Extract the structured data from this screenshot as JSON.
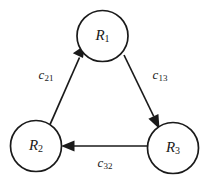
{
  "diagram": {
    "type": "directed-graph",
    "title": "",
    "background_color": "#ffffff",
    "stroke_color": "#1a1a1a",
    "nodes": [
      {
        "id": "R1",
        "base": "R",
        "subscript": "1",
        "label": "R1",
        "cx": 102.5,
        "cy": 36,
        "r": 25.5
      },
      {
        "id": "R2",
        "base": "R",
        "subscript": "2",
        "label": "R2",
        "cx": 36,
        "cy": 146,
        "r": 25.5
      },
      {
        "id": "R3",
        "base": "R",
        "subscript": "3",
        "label": "R3",
        "cx": 173,
        "cy": 148,
        "r": 25.5
      }
    ],
    "edges": [
      {
        "id": "e21",
        "from": "R2",
        "to": "R1",
        "base": "c",
        "subscript": "21",
        "label": "c21",
        "label_x": 46,
        "label_y": 76
      },
      {
        "id": "e13",
        "from": "R1",
        "to": "R3",
        "base": "c",
        "subscript": "13",
        "label": "c13",
        "label_x": 160,
        "label_y": 76
      },
      {
        "id": "e32",
        "from": "R3",
        "to": "R2",
        "base": "c",
        "subscript": "32",
        "label": "c32",
        "label_x": 105,
        "label_y": 164
      }
    ]
  }
}
